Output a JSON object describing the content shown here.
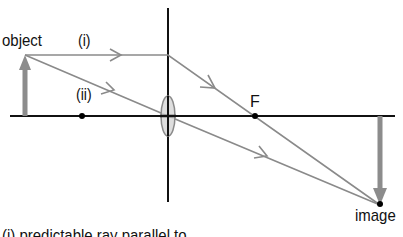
{
  "diagram": {
    "type": "ray-diagram-converging-lens",
    "labels": {
      "object": "object",
      "ray_i": "(i)",
      "ray_ii": "(ii)",
      "focal_point": "F",
      "image": "image",
      "caption": "(i) predictable ray parallel to"
    },
    "colors": {
      "axis": "#111111",
      "ray": "#8a8a8a",
      "arrow_fill": "#8c8c8c",
      "lens_fill": "#d8d8d8",
      "lens_stroke": "#8a8a8a",
      "point": "#000000"
    },
    "elements": {
      "principal_axis": {
        "x1": 10,
        "y1": 116,
        "x2": 395,
        "y2": 116
      },
      "lens_line": {
        "x": 168,
        "y1": 8,
        "y2": 202
      },
      "lens": {
        "cx": 168,
        "cy": 116,
        "rx": 7,
        "ry": 20
      },
      "object_arrow": {
        "x": 25,
        "base_y": 116,
        "tip_y": 55
      },
      "left_focal_point": {
        "x": 82,
        "y": 116
      },
      "right_focal_point": {
        "x": 255,
        "y": 116
      },
      "image_arrow": {
        "x": 380,
        "base_y": 116,
        "tip_y": 205
      },
      "ray_i": [
        [
          25,
          55
        ],
        [
          168,
          55
        ],
        [
          380,
          205
        ]
      ],
      "ray_ii": [
        [
          25,
          55
        ],
        [
          168,
          116
        ],
        [
          380,
          205
        ]
      ]
    }
  }
}
